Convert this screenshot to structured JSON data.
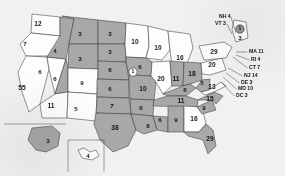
{
  "map": {
    "title": "United States Electoral College Map",
    "legend": {
      "shaded_meaning": "shaded state",
      "white_meaning": "unshaded state"
    },
    "colors": {
      "shaded": "#a8a8a8",
      "white": "#fdfdfd",
      "border": "#3b3b3b",
      "background": "#f2f1ef",
      "label": "#1a1a1a"
    },
    "states": [
      {
        "code": "WA",
        "label": "12",
        "shaded": false,
        "x": 38,
        "y": 24
      },
      {
        "code": "OR",
        "label": "7",
        "shaded": false,
        "x": 25,
        "y": 44
      },
      {
        "code": "CA",
        "label": "55",
        "shaded": false,
        "x": 22,
        "y": 88
      },
      {
        "code": "NV",
        "label": "6",
        "shaded": false,
        "x": 40,
        "y": 72
      },
      {
        "code": "ID",
        "label": "4",
        "shaded": true,
        "x": 55,
        "y": 51
      },
      {
        "code": "MT",
        "label": "3",
        "shaded": true,
        "x": 80,
        "y": 34
      },
      {
        "code": "WY",
        "label": "3",
        "shaded": true,
        "x": 80,
        "y": 59
      },
      {
        "code": "UT",
        "label": "6",
        "shaded": true,
        "x": 55,
        "y": 79
      },
      {
        "code": "AZ",
        "label": "11",
        "shaded": false,
        "x": 51,
        "y": 106
      },
      {
        "code": "CO",
        "label": "9",
        "shaded": false,
        "x": 82,
        "y": 83
      },
      {
        "code": "NM",
        "label": "5",
        "shaded": false,
        "x": 76,
        "y": 109
      },
      {
        "code": "ND",
        "label": "3",
        "shaded": true,
        "x": 110,
        "y": 34
      },
      {
        "code": "SD",
        "label": "3",
        "shaded": true,
        "x": 110,
        "y": 52
      },
      {
        "code": "NE",
        "label": "6",
        "shaded": true,
        "x": 110,
        "y": 70
      },
      {
        "code": "KS",
        "label": "6",
        "shaded": true,
        "x": 110,
        "y": 89
      },
      {
        "code": "OK",
        "label": "7",
        "shaded": true,
        "x": 112,
        "y": 106
      },
      {
        "code": "TX",
        "label": "38",
        "shaded": true,
        "x": 115,
        "y": 128
      },
      {
        "code": "MN",
        "label": "10",
        "shaded": false,
        "x": 135,
        "y": 42
      },
      {
        "code": "IA",
        "label": "6",
        "shaded": true,
        "x": 140,
        "y": 67
      },
      {
        "code": "MO",
        "label": "10",
        "shaded": true,
        "x": 143,
        "y": 89
      },
      {
        "code": "AR",
        "label": "6",
        "shaded": true,
        "x": 141,
        "y": 108
      },
      {
        "code": "LA",
        "label": "8",
        "shaded": true,
        "x": 148,
        "y": 126
      },
      {
        "code": "WI",
        "label": "10",
        "shaded": false,
        "x": 158,
        "y": 48
      },
      {
        "code": "IL",
        "label": "20",
        "shaded": false,
        "x": 161,
        "y": 79
      },
      {
        "code": "MS",
        "label": "6",
        "shaded": true,
        "x": 160,
        "y": 120
      },
      {
        "code": "MI",
        "label": "16",
        "shaded": false,
        "x": 180,
        "y": 58
      },
      {
        "code": "IN",
        "label": "11",
        "shaded": true,
        "x": 176,
        "y": 79
      },
      {
        "code": "OH",
        "label": "18",
        "shaded": true,
        "x": 192,
        "y": 74
      },
      {
        "code": "KY",
        "label": "8",
        "shaded": true,
        "x": 185,
        "y": 90
      },
      {
        "code": "TN",
        "label": "11",
        "shaded": true,
        "x": 181,
        "y": 101
      },
      {
        "code": "AL",
        "label": "9",
        "shaded": true,
        "x": 176,
        "y": 120
      },
      {
        "code": "GA",
        "label": "16",
        "shaded": false,
        "x": 194,
        "y": 119
      },
      {
        "code": "FL",
        "label": "29",
        "shaded": true,
        "x": 210,
        "y": 139
      },
      {
        "code": "SC",
        "label": "9",
        "shaded": true,
        "x": 204,
        "y": 108
      },
      {
        "code": "NC",
        "label": "15",
        "shaded": true,
        "x": 210,
        "y": 99
      },
      {
        "code": "WV",
        "label": "5",
        "shaded": true,
        "x": 202,
        "y": 83
      },
      {
        "code": "VA",
        "label": "13",
        "shaded": false,
        "x": 212,
        "y": 87
      },
      {
        "code": "PA",
        "label": "20",
        "shaded": false,
        "x": 212,
        "y": 65
      },
      {
        "code": "NY",
        "label": "29",
        "shaded": false,
        "x": 214,
        "y": 52
      },
      {
        "code": "ME",
        "label": "3",
        "shaded": false,
        "x": 240,
        "y": 38
      },
      {
        "code": "AK",
        "label": "3",
        "shaded": true,
        "x": 48,
        "y": 141
      },
      {
        "code": "HI",
        "label": "4",
        "shaded": false,
        "x": 88,
        "y": 156
      }
    ],
    "split_vote_badges": [
      {
        "code": "NE-2",
        "label": "1",
        "shaded": false,
        "x": 133,
        "y": 72
      },
      {
        "code": "ME-2",
        "label": "1",
        "shaded": true,
        "x": 240,
        "y": 29
      }
    ],
    "callouts": [
      {
        "code": "NH",
        "label": "NH 4",
        "text_x": 219,
        "text_y": 17,
        "anchor_x": 236,
        "anchor_y": 33
      },
      {
        "code": "VT",
        "label": "VT 3",
        "text_x": 215,
        "text_y": 24,
        "anchor_x": 232,
        "anchor_y": 34
      },
      {
        "code": "MA",
        "label": "MA 11",
        "text_x": 249,
        "text_y": 52,
        "anchor_x": 236,
        "anchor_y": 52
      },
      {
        "code": "RI",
        "label": "RI 4",
        "text_x": 251,
        "text_y": 60,
        "anchor_x": 236,
        "anchor_y": 55
      },
      {
        "code": "CT",
        "label": "CT 7",
        "text_x": 249,
        "text_y": 68,
        "anchor_x": 233,
        "anchor_y": 57
      },
      {
        "code": "NJ",
        "label": "NJ 14",
        "text_x": 244,
        "text_y": 76,
        "anchor_x": 228,
        "anchor_y": 68
      },
      {
        "code": "DE",
        "label": "DE 3",
        "text_x": 241,
        "text_y": 83,
        "anchor_x": 226,
        "anchor_y": 73
      },
      {
        "code": "MD",
        "label": "MD 10",
        "text_x": 238,
        "text_y": 89,
        "anchor_x": 223,
        "anchor_y": 77
      },
      {
        "code": "DC",
        "label": "DC 3",
        "text_x": 236,
        "text_y": 96,
        "anchor_x": 221,
        "anchor_y": 82
      }
    ]
  }
}
